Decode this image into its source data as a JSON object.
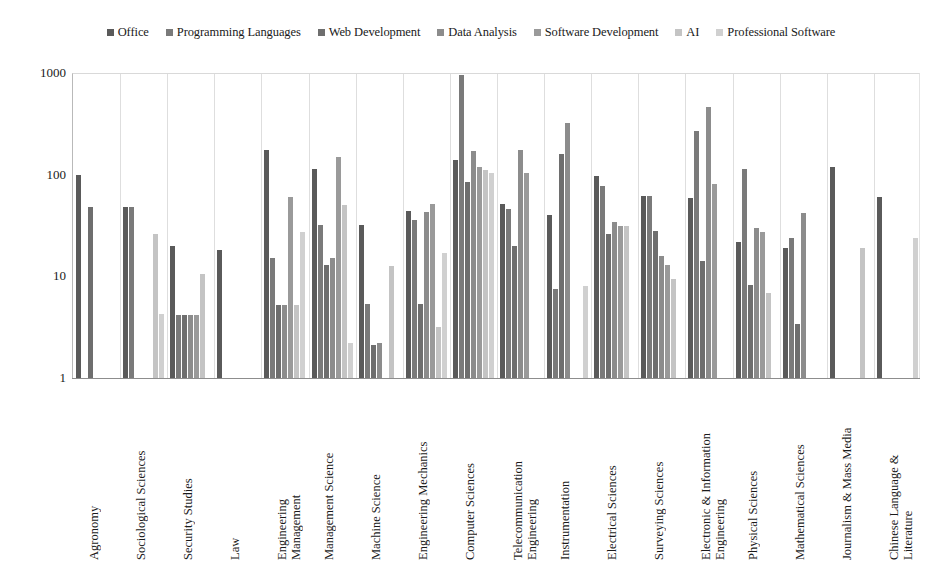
{
  "chart_data": {
    "type": "bar",
    "title": "",
    "xlabel": "",
    "ylabel": "",
    "yscale": "log",
    "ylim": [
      1,
      1000
    ],
    "yticks": [
      "1",
      "10",
      "100",
      "1000"
    ],
    "grid": "vertical-group-separators",
    "legend_position": "top-center",
    "categories": [
      "Agronomy",
      "Sociological Sciences",
      "Security Studies",
      "Law",
      "Engineering\nManagement",
      "Management Science",
      "Machine Science",
      "Engineering Mechanics",
      "Computer Sciences",
      "Telecommunication\nEngineering",
      "Instrumentation",
      "Electrical Sciences",
      "Surveying Sciences",
      "Electronic & Information\nEngineering",
      "Physical Sciences",
      "Mathematical Sciences",
      "Journalism & Mass Media",
      "Chinese Language &\nLiterature"
    ],
    "series": [
      {
        "name": "Office",
        "color": "#5a5a5a",
        "values": [
          100,
          48,
          20,
          18,
          175,
          115,
          32,
          44,
          140,
          52,
          40,
          98,
          62,
          59,
          22,
          19,
          120,
          60
        ]
      },
      {
        "name": "Programming Languages",
        "color": "#7a7a7a",
        "values": [
          null,
          48,
          4.2,
          null,
          15,
          32,
          5.4,
          36,
          950,
          46,
          7.5,
          78,
          62,
          270,
          115,
          24,
          null,
          null
        ]
      },
      {
        "name": "Web Development",
        "color": "#6e6e6e",
        "values": [
          48,
          null,
          4.2,
          null,
          5.2,
          13,
          2.1,
          5.4,
          85,
          20,
          160,
          26,
          28,
          14,
          8.2,
          3.4,
          null,
          null
        ]
      },
      {
        "name": "Data Analysis",
        "color": "#8c8c8c",
        "values": [
          null,
          null,
          4.2,
          null,
          5.2,
          15,
          2.2,
          43,
          170,
          175,
          320,
          34,
          16,
          460,
          30,
          42,
          null,
          null
        ]
      },
      {
        "name": "Software Development",
        "color": "#9a9a9a",
        "values": [
          null,
          null,
          4.2,
          null,
          60,
          148,
          null,
          51,
          120,
          105,
          null,
          31,
          13,
          81,
          27,
          null,
          null,
          null
        ]
      },
      {
        "name": "AI",
        "color": "#c4c4c4",
        "values": [
          null,
          26,
          10.5,
          null,
          5.2,
          50,
          12.5,
          3.2,
          110,
          null,
          null,
          31,
          9.5,
          null,
          6.8,
          null,
          19,
          null
        ]
      },
      {
        "name": "Professional Software",
        "color": "#d0d0d0",
        "values": [
          null,
          4.3,
          null,
          null,
          27,
          2.2,
          null,
          17,
          105,
          null,
          8,
          null,
          null,
          null,
          null,
          null,
          null,
          24
        ]
      }
    ]
  },
  "legend": {
    "items": [
      {
        "label": "Office",
        "color": "#5a5a5a"
      },
      {
        "label": "Programming Languages",
        "color": "#7a7a7a"
      },
      {
        "label": "Web Development",
        "color": "#6e6e6e"
      },
      {
        "label": "Data Analysis",
        "color": "#8c8c8c"
      },
      {
        "label": "Software Development",
        "color": "#9a9a9a"
      },
      {
        "label": "AI",
        "color": "#c4c4c4"
      },
      {
        "label": "Professional Software",
        "color": "#d0d0d0"
      }
    ]
  }
}
